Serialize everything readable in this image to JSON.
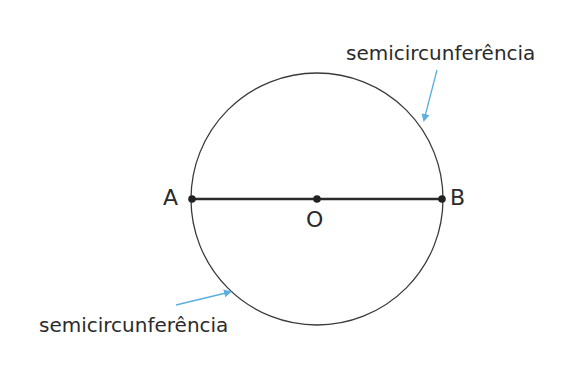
{
  "diagram": {
    "type": "circle-with-diameter",
    "circle": {
      "center": [
        317,
        199
      ],
      "radius": 126,
      "stroke": "#3a3a3a"
    },
    "diameter": {
      "from": "A",
      "to": "B",
      "through": "O",
      "stroke": "#2b2b2b"
    },
    "points": [
      {
        "id": "A",
        "label": "A",
        "x": 192,
        "y": 199
      },
      {
        "id": "O",
        "label": "O",
        "x": 317,
        "y": 199
      },
      {
        "id": "B",
        "label": "B",
        "x": 442,
        "y": 199
      }
    ],
    "annotations": [
      {
        "id": "upper",
        "label": "semicircunferência",
        "arrow_color": "#5aaee0"
      },
      {
        "id": "lower",
        "label": "semicircunferência",
        "arrow_color": "#5aaee0"
      }
    ]
  }
}
